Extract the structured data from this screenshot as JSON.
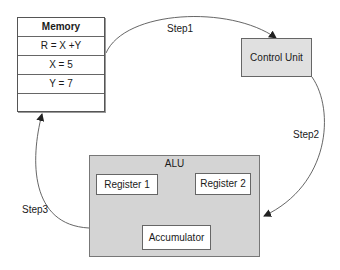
{
  "memory": {
    "title": "Memory",
    "rows": [
      "R = X +Y",
      "X = 5",
      "Y = 7",
      ""
    ]
  },
  "control_unit": {
    "label": "Control Unit"
  },
  "alu": {
    "label": "ALU",
    "register1": "Register 1",
    "register2": "Register 2",
    "accumulator": "Accumulator"
  },
  "steps": {
    "step1": "Step1",
    "step2": "Step2",
    "step3": "Step3"
  },
  "colors": {
    "box_fill_gray": "#d4d4d4",
    "control_unit_fill": "#e0e0e0",
    "line": "#555555"
  }
}
